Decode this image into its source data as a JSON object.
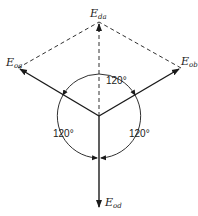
{
  "diagram": {
    "type": "phasor",
    "phasors": [
      {
        "id": "oa",
        "label_main": "E",
        "label_sub": "oa",
        "direction_deg": 150
      },
      {
        "id": "ob",
        "label_main": "E",
        "label_sub": "ob",
        "direction_deg": 30
      },
      {
        "id": "od",
        "label_main": "E",
        "label_sub": "od",
        "direction_deg": 270
      },
      {
        "id": "da",
        "label_main": "E",
        "label_sub": "da",
        "direction_deg": 90,
        "style": "dashed"
      }
    ],
    "angles": [
      {
        "label": "120°",
        "between": [
          "oa",
          "ob"
        ]
      },
      {
        "label": "120°",
        "between": [
          "oa",
          "od"
        ]
      },
      {
        "label": "120°",
        "between": [
          "ob",
          "od"
        ]
      }
    ],
    "colors": {
      "line": "#1a1a1a",
      "background": "#ffffff"
    }
  }
}
